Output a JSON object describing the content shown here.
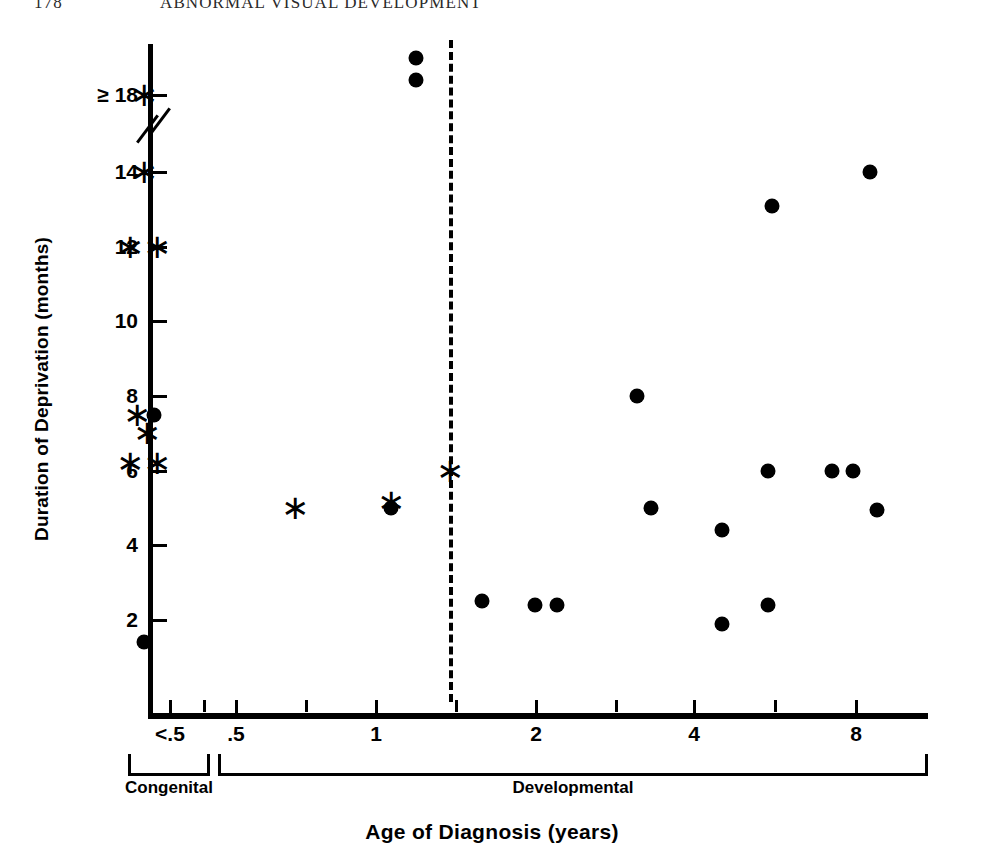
{
  "running_head": {
    "page_number": "178",
    "title": "ABNORMAL VISUAL DEVELOPMENT"
  },
  "chart_data": {
    "type": "scatter",
    "title": "",
    "xlabel": "Age of Diagnosis (years)",
    "ylabel": "Duration of Deprivation (months)",
    "x_scale": "log-with-offscale-category",
    "x_tick_labels": [
      "<.5",
      ".5",
      "1",
      "2",
      "4",
      "8"
    ],
    "x_tick_values": [
      0.35,
      0.5,
      1,
      2,
      4,
      8
    ],
    "y_tick_labels": [
      "≥ 18",
      "14",
      "12",
      "10",
      "8",
      "6",
      "4",
      "2"
    ],
    "y_tick_values": [
      18,
      14,
      12,
      10,
      8,
      6,
      4,
      2
    ],
    "y_axis_break_between": [
      14,
      18
    ],
    "grid": false,
    "legend": [
      {
        "marker": "filled-circle",
        "name": "circle-marker"
      },
      {
        "marker": "asterisk",
        "name": "asterisk-marker"
      }
    ],
    "annotations": [
      {
        "name": "divider",
        "type": "vertical-dashed-line",
        "x": 1.4
      }
    ],
    "group_brackets": [
      {
        "label": "Congenital",
        "x_from": 0.28,
        "x_to": 0.45
      },
      {
        "label": "Developmental",
        "x_from": 0.47,
        "x_to": 11.5
      }
    ],
    "series": [
      {
        "name": "circle",
        "marker": "filled-circle",
        "points": [
          {
            "x": 1.12,
            "y": 19.0
          },
          {
            "x": 1.12,
            "y": 18.4
          },
          {
            "x": 8.5,
            "y": 14.0
          },
          {
            "x": 5.5,
            "y": 13.1
          },
          {
            "x": 3.0,
            "y": 8.0
          },
          {
            "x": 0.38,
            "y": 7.5
          },
          {
            "x": 5.4,
            "y": 6.0
          },
          {
            "x": 7.2,
            "y": 6.0
          },
          {
            "x": 7.9,
            "y": 6.0
          },
          {
            "x": 1.0,
            "y": 5.0
          },
          {
            "x": 3.2,
            "y": 5.0
          },
          {
            "x": 8.8,
            "y": 4.95
          },
          {
            "x": 4.4,
            "y": 4.4
          },
          {
            "x": 1.5,
            "y": 2.5
          },
          {
            "x": 1.9,
            "y": 2.4
          },
          {
            "x": 2.1,
            "y": 2.4
          },
          {
            "x": 5.4,
            "y": 2.4
          },
          {
            "x": 4.4,
            "y": 1.9
          },
          {
            "x": 0.35,
            "y": 1.4
          }
        ]
      },
      {
        "name": "asterisk",
        "marker": "asterisk",
        "points": [
          {
            "x": 0.35,
            "y": 18.0
          },
          {
            "x": 0.35,
            "y": 14.0
          },
          {
            "x": 0.31,
            "y": 12.0
          },
          {
            "x": 0.39,
            "y": 12.0
          },
          {
            "x": 0.33,
            "y": 7.5
          },
          {
            "x": 0.36,
            "y": 7.0
          },
          {
            "x": 0.31,
            "y": 6.2
          },
          {
            "x": 0.39,
            "y": 6.2
          },
          {
            "x": 1.3,
            "y": 6.0
          },
          {
            "x": 0.65,
            "y": 5.0
          },
          {
            "x": 1.0,
            "y": 5.15
          }
        ]
      }
    ]
  }
}
